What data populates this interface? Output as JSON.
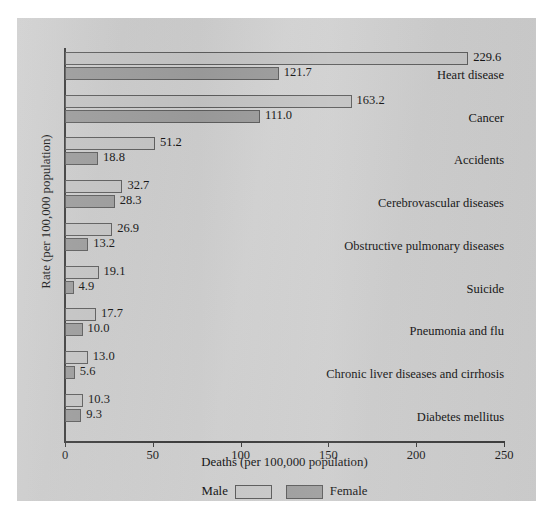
{
  "chart_data": {
    "type": "bar",
    "orientation": "horizontal",
    "title": "",
    "xlabel": "Deaths (per 100,000 population)",
    "ylabel": "Rate (per 100,000 population)",
    "xlim": [
      0,
      250
    ],
    "xticks": [
      0,
      50,
      100,
      150,
      200,
      250
    ],
    "xtick_labels": [
      "0",
      "50",
      "100",
      "150",
      "200",
      "250"
    ],
    "grid": false,
    "legend_position": "bottom",
    "categories": [
      "Heart disease",
      "Cancer",
      "Accidents",
      "Cerebrovascular diseases",
      "Obstructive pulmonary diseases",
      "Suicide",
      "Pneumonia and flu",
      "Chronic liver diseases and cirrhosis",
      "Diabetes mellitus"
    ],
    "series": [
      {
        "name": "Male",
        "color": "#c3c3c3",
        "values": [
          229.6,
          163.2,
          51.2,
          32.7,
          26.9,
          19.1,
          17.7,
          13.0,
          10.3
        ],
        "value_labels": [
          "229.6",
          "163.2",
          "51.2",
          "32.7",
          "26.9",
          "19.1",
          "17.7",
          "13.0",
          "10.3"
        ]
      },
      {
        "name": "Female",
        "color": "#9b9b9b",
        "values": [
          121.7,
          111.0,
          18.8,
          28.3,
          13.2,
          4.9,
          10.0,
          5.6,
          9.3
        ],
        "value_labels": [
          "121.7",
          "111.0",
          "18.8",
          "28.3",
          "13.2",
          "4.9",
          "10.0",
          "5.6",
          "9.3"
        ]
      }
    ]
  },
  "legend": {
    "male_label": "Male",
    "female_label": "Female"
  },
  "colors": {
    "male_bar": "#c3c3c3",
    "female_bar": "#9b9b9b",
    "axis": "#3d3d3d",
    "background": "#cfcfcf",
    "text": "#151515"
  }
}
